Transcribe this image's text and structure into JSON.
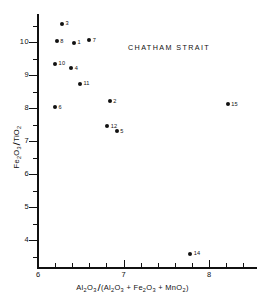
{
  "chart_data": {
    "type": "scatter",
    "title": "CHATHAM  STRAIT",
    "xlabel": "Al2O3 / (Al2O3 + Fe2O3 + MnO2)",
    "ylabel": "Fe2O3 / TiO2",
    "xlim": [
      6,
      8.57
    ],
    "ylim": [
      3.2,
      10.9
    ],
    "grid": false,
    "legend": null,
    "x_ticks_major": [
      6,
      7,
      8
    ],
    "x_ticks_major_labels": [
      "6",
      "7",
      "8"
    ],
    "x_ticks_minor": [
      6.2,
      6.4,
      6.6,
      6.8,
      7.2,
      7.4,
      7.6,
      7.8,
      8.2,
      8.4
    ],
    "y_ticks_major": [
      10,
      9,
      8,
      7,
      6,
      5,
      4
    ],
    "y_ticks_major_labels": [
      "10",
      "9",
      "8",
      "7",
      "6",
      "5",
      "4"
    ],
    "y_ticks_minor": [
      10.5,
      9.5,
      8.5,
      7.5,
      6.5,
      5.5,
      4.5,
      3.5
    ],
    "points": [
      {
        "label": "3",
        "x": 6.28,
        "y": 10.55
      },
      {
        "label": "8",
        "x": 6.22,
        "y": 10.03
      },
      {
        "label": "1",
        "x": 6.42,
        "y": 9.97
      },
      {
        "label": "7",
        "x": 6.6,
        "y": 10.06
      },
      {
        "label": "10",
        "x": 6.2,
        "y": 9.34
      },
      {
        "label": "4",
        "x": 6.39,
        "y": 9.21
      },
      {
        "label": "11",
        "x": 6.49,
        "y": 8.73
      },
      {
        "label": "6",
        "x": 6.2,
        "y": 8.03
      },
      {
        "label": "2",
        "x": 6.84,
        "y": 8.21
      },
      {
        "label": "12",
        "x": 6.81,
        "y": 7.45
      },
      {
        "label": "5",
        "x": 6.92,
        "y": 7.3
      },
      {
        "label": "15",
        "x": 8.22,
        "y": 8.12
      },
      {
        "label": "14",
        "x": 7.78,
        "y": 3.58
      }
    ]
  },
  "axis_title_parts": {
    "y": {
      "num_el": "Fe",
      "num_sub1": "2",
      "num_el2": "O",
      "num_sub2": "3",
      "den_el": "TiO",
      "den_sub": "2"
    },
    "x": {
      "numerator": {
        "e1": "Al",
        "s1": "2",
        "e2": "O",
        "s2": "3"
      },
      "denominator_open": "(",
      "d1": {
        "e1": "Al",
        "s1": "2",
        "e2": "O",
        "s2": "3"
      },
      "plus1": "+",
      "d2": {
        "e1": "Fe",
        "s1": "2",
        "e2": "O",
        "s2": "3"
      },
      "plus2": "+",
      "d3": {
        "e1": "MnO",
        "s1": "2"
      },
      "denominator_close": ")"
    }
  }
}
